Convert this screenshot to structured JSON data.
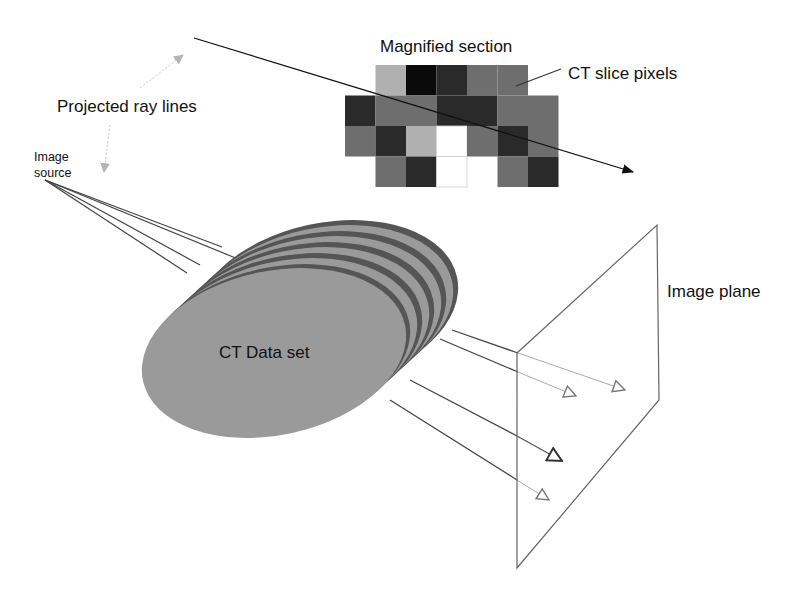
{
  "labels": {
    "magnified_section": "Magnified section",
    "ct_slice_pixels": "CT slice pixels",
    "projected_ray_lines": "Projected ray lines",
    "image_source_line1": "Image",
    "image_source_line2": "source",
    "ct_data_set": "CT Data set",
    "image_plane": "Image plane"
  },
  "colors": {
    "background": "#ffffff",
    "slice_face": "#9a9a9a",
    "slice_rim": "#555555",
    "ray_line": "#444444",
    "ray_line_light": "#aaaaaa",
    "plane_edge": "#666666",
    "pixel_white": "#ffffff",
    "pixel_light": "#b0b0b0",
    "pixel_mid": "#6e6e6e",
    "pixel_dark": "#2a2a2a",
    "pixel_black": "#0a0a0a"
  },
  "pixel_grid": {
    "origin_x": 345,
    "origin_y": 65,
    "cell": 30.5,
    "rows": [
      [
        "none",
        "light",
        "black",
        "dark",
        "mid",
        "mid",
        "none"
      ],
      [
        "dark",
        "mid",
        "mid",
        "dark",
        "dark",
        "mid",
        "mid"
      ],
      [
        "mid",
        "dark",
        "light",
        "white",
        "mid",
        "dark",
        "mid"
      ],
      [
        "none",
        "mid",
        "dark",
        "white",
        "none",
        "mid",
        "dark"
      ]
    ]
  },
  "ct_stack": {
    "slice_count": 5,
    "front_center": [
      278,
      349
    ],
    "rx": 134,
    "ry": 82,
    "rotation_deg": -12,
    "step": [
      12,
      -11
    ]
  },
  "image_source_point": [
    45,
    180
  ],
  "source_rays": [
    [
      222,
      247
    ],
    [
      238,
      259
    ],
    [
      200,
      265
    ],
    [
      187,
      273
    ]
  ],
  "exit_rays": [
    {
      "start": [
        452,
        330
      ],
      "hit": [
        518,
        353
      ],
      "tip": [
        625,
        390
      ]
    },
    {
      "start": [
        440,
        339
      ],
      "hit": [
        518,
        372
      ],
      "tip": [
        576,
        396
      ]
    },
    {
      "start": [
        410,
        380
      ],
      "hit": [
        517,
        436
      ],
      "tip": [
        562,
        461
      ]
    },
    {
      "start": [
        390,
        400
      ],
      "hit": [
        517,
        480
      ],
      "tip": [
        549,
        500
      ]
    }
  ],
  "image_plane": {
    "corners": [
      [
        517,
        353
      ],
      [
        657,
        225
      ],
      [
        659,
        400
      ],
      [
        517,
        568
      ]
    ]
  },
  "magnified_ray": {
    "start": [
      194,
      38
    ],
    "end": [
      633,
      172
    ]
  }
}
